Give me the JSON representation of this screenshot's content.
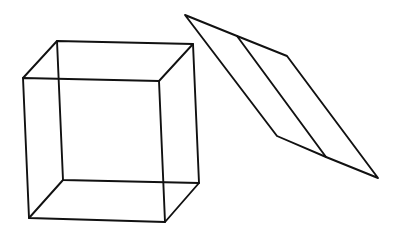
{
  "figure": {
    "background": "#ffffff",
    "stroke_color": "#111111",
    "shapes": [
      {
        "name": "wireframe-cube",
        "vertices": {
          "back_top_left": [
            57,
            41
          ],
          "back_top_right": [
            193,
            44
          ],
          "back_bottom_left": [
            63,
            180
          ],
          "back_bottom_right": [
            199,
            183
          ],
          "front_top_left": [
            23,
            78
          ],
          "front_top_right": [
            159,
            81
          ],
          "front_bottom_left": [
            29,
            218
          ],
          "front_bottom_right": [
            165,
            222
          ]
        }
      },
      {
        "name": "flat-parallelogram-prism",
        "vertices": {
          "top_tip": [
            185,
            15
          ],
          "mid_top": [
            237,
            36
          ],
          "right_top": [
            287,
            56
          ],
          "left_bottom": [
            277,
            136
          ],
          "mid_bottom": [
            326,
            157
          ],
          "bottom_tip": [
            378,
            178
          ]
        }
      }
    ]
  }
}
